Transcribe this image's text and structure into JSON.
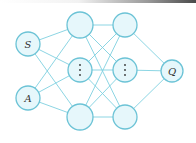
{
  "diagram": {
    "type": "neural-network",
    "colors": {
      "edge": "#7fd0e0",
      "node_fill": "#e6f7fb",
      "node_stroke": "#6cc3d6",
      "label": "#333333"
    },
    "inputs": [
      {
        "id": "S",
        "label": "S"
      },
      {
        "id": "A",
        "label": "A"
      }
    ],
    "hidden_layers": [
      {
        "nodes": [
          "",
          "⋮",
          ""
        ]
      },
      {
        "nodes": [
          "",
          "⋮",
          ""
        ]
      }
    ],
    "output": {
      "id": "Q",
      "label": "Q"
    }
  }
}
